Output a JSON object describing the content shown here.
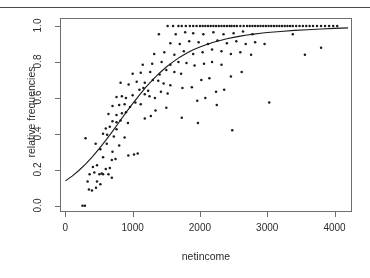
{
  "figure": {
    "xlabel": "netincome",
    "ylabel": "relative frequencies",
    "point_color": "#1a1a1a",
    "curve_color": "#1a1a1a",
    "axis_color": "#6e6e6e"
  },
  "axis": {
    "x_ticks": [
      "0",
      "1000",
      "2000",
      "3000",
      "4000"
    ],
    "y_ticks": [
      "0.0",
      "0.2",
      "0.4",
      "0.6",
      "0.8",
      "1.0"
    ]
  },
  "chart_data": {
    "type": "scatter",
    "title": "",
    "xlabel": "netincome",
    "ylabel": "relative frequencies",
    "xlim": [
      -80,
      4260
    ],
    "ylim": [
      -0.035,
      1.045
    ],
    "xticks": [
      0,
      1000,
      2000,
      3000,
      4000
    ],
    "yticks": [
      0.0,
      0.2,
      0.4,
      0.6,
      0.8,
      1.0
    ],
    "grid": false,
    "legend": null,
    "series": [
      {
        "name": "relative frequencies",
        "marker": "point",
        "points": [
          [
            255,
            0.0
          ],
          [
            290,
            0.0
          ],
          [
            350,
            0.09
          ],
          [
            395,
            0.085
          ],
          [
            455,
            0.1
          ],
          [
            330,
            0.135
          ],
          [
            470,
            0.135
          ],
          [
            520,
            0.12
          ],
          [
            360,
            0.175
          ],
          [
            430,
            0.185
          ],
          [
            505,
            0.175
          ],
          [
            540,
            0.18
          ],
          [
            560,
            0.175
          ],
          [
            640,
            0.175
          ],
          [
            690,
            0.155
          ],
          [
            410,
            0.215
          ],
          [
            470,
            0.225
          ],
          [
            600,
            0.205
          ],
          [
            660,
            0.21
          ],
          [
            300,
            0.375
          ],
          [
            560,
            0.27
          ],
          [
            690,
            0.255
          ],
          [
            745,
            0.26
          ],
          [
            935,
            0.28
          ],
          [
            1020,
            0.285
          ],
          [
            1075,
            0.29
          ],
          [
            520,
            0.315
          ],
          [
            700,
            0.3
          ],
          [
            450,
            0.345
          ],
          [
            615,
            0.345
          ],
          [
            800,
            0.335
          ],
          [
            560,
            0.4
          ],
          [
            620,
            0.395
          ],
          [
            720,
            0.385
          ],
          [
            880,
            0.38
          ],
          [
            600,
            0.43
          ],
          [
            660,
            0.44
          ],
          [
            760,
            0.425
          ],
          [
            700,
            0.47
          ],
          [
            760,
            0.465
          ],
          [
            820,
            0.475
          ],
          [
            930,
            0.46
          ],
          [
            640,
            0.51
          ],
          [
            760,
            0.505
          ],
          [
            840,
            0.515
          ],
          [
            900,
            0.52
          ],
          [
            1180,
            0.485
          ],
          [
            1270,
            0.5
          ],
          [
            700,
            0.555
          ],
          [
            800,
            0.56
          ],
          [
            880,
            0.565
          ],
          [
            960,
            0.55
          ],
          [
            1040,
            0.575
          ],
          [
            1120,
            0.565
          ],
          [
            760,
            0.605
          ],
          [
            840,
            0.61
          ],
          [
            900,
            0.6
          ],
          [
            1000,
            0.615
          ],
          [
            1180,
            0.62
          ],
          [
            1250,
            0.61
          ],
          [
            1330,
            0.6
          ],
          [
            1100,
            0.645
          ],
          [
            1160,
            0.655
          ],
          [
            1230,
            0.64
          ],
          [
            1420,
            0.635
          ],
          [
            1520,
            0.625
          ],
          [
            820,
            0.685
          ],
          [
            940,
            0.675
          ],
          [
            1060,
            0.69
          ],
          [
            1180,
            0.685
          ],
          [
            1300,
            0.7
          ],
          [
            1380,
            0.695
          ],
          [
            1460,
            0.68
          ],
          [
            1560,
            0.67
          ],
          [
            1740,
            0.655
          ],
          [
            1880,
            0.66
          ],
          [
            1000,
            0.735
          ],
          [
            1120,
            0.74
          ],
          [
            1260,
            0.745
          ],
          [
            1400,
            0.73
          ],
          [
            1500,
            0.755
          ],
          [
            1620,
            0.745
          ],
          [
            1720,
            0.735
          ],
          [
            1150,
            0.785
          ],
          [
            1290,
            0.79
          ],
          [
            1430,
            0.8
          ],
          [
            1560,
            0.785
          ],
          [
            1680,
            0.8
          ],
          [
            1800,
            0.795
          ],
          [
            1920,
            0.78
          ],
          [
            2060,
            0.79
          ],
          [
            2180,
            0.8
          ],
          [
            2320,
            0.785
          ],
          [
            1320,
            0.845
          ],
          [
            1470,
            0.855
          ],
          [
            1620,
            0.84
          ],
          [
            1760,
            0.86
          ],
          [
            1900,
            0.845
          ],
          [
            2040,
            0.855
          ],
          [
            2180,
            0.87
          ],
          [
            2320,
            0.86
          ],
          [
            2460,
            0.845
          ],
          [
            2600,
            0.855
          ],
          [
            2760,
            0.84
          ],
          [
            1560,
            0.905
          ],
          [
            1700,
            0.9
          ],
          [
            1840,
            0.915
          ],
          [
            1980,
            0.91
          ],
          [
            2120,
            0.9
          ],
          [
            2260,
            0.92
          ],
          [
            2400,
            0.905
          ],
          [
            2540,
            0.915
          ],
          [
            2680,
            0.9
          ],
          [
            2820,
            0.91
          ],
          [
            2960,
            0.9
          ],
          [
            1390,
            0.955
          ],
          [
            1640,
            0.955
          ],
          [
            1780,
            0.965
          ],
          [
            1900,
            0.96
          ],
          [
            2050,
            0.955
          ],
          [
            2200,
            0.965
          ],
          [
            2350,
            0.955
          ],
          [
            2500,
            0.96
          ],
          [
            2640,
            0.97
          ],
          [
            2780,
            0.955
          ],
          [
            3380,
            0.955
          ],
          [
            1520,
            1.0
          ],
          [
            1600,
            1.0
          ],
          [
            1680,
            1.0
          ],
          [
            1730,
            1.0
          ],
          [
            1790,
            1.0
          ],
          [
            1850,
            1.0
          ],
          [
            1900,
            1.0
          ],
          [
            1950,
            1.0
          ],
          [
            2000,
            1.0
          ],
          [
            2040,
            1.0
          ],
          [
            2080,
            1.0
          ],
          [
            2120,
            1.0
          ],
          [
            2160,
            1.0
          ],
          [
            2200,
            1.0
          ],
          [
            2240,
            1.0
          ],
          [
            2280,
            1.0
          ],
          [
            2320,
            1.0
          ],
          [
            2360,
            1.0
          ],
          [
            2400,
            1.0
          ],
          [
            2440,
            1.0
          ],
          [
            2470,
            1.0
          ],
          [
            2510,
            1.0
          ],
          [
            2550,
            1.0
          ],
          [
            2600,
            1.0
          ],
          [
            2650,
            1.0
          ],
          [
            2700,
            1.0
          ],
          [
            2740,
            1.0
          ],
          [
            2780,
            1.0
          ],
          [
            2820,
            1.0
          ],
          [
            2860,
            1.0
          ],
          [
            2900,
            1.0
          ],
          [
            2940,
            1.0
          ],
          [
            2980,
            1.0
          ],
          [
            3020,
            1.0
          ],
          [
            3060,
            1.0
          ],
          [
            3100,
            1.0
          ],
          [
            3140,
            1.0
          ],
          [
            3180,
            1.0
          ],
          [
            3220,
            1.0
          ],
          [
            3260,
            1.0
          ],
          [
            3300,
            1.0
          ],
          [
            3340,
            1.0
          ],
          [
            3380,
            1.0
          ],
          [
            3430,
            1.0
          ],
          [
            3480,
            1.0
          ],
          [
            3530,
            1.0
          ],
          [
            3580,
            1.0
          ],
          [
            3630,
            1.0
          ],
          [
            3680,
            1.0
          ],
          [
            3740,
            1.0
          ],
          [
            3800,
            1.0
          ],
          [
            3860,
            1.0
          ],
          [
            3920,
            1.0
          ],
          [
            3980,
            1.0
          ],
          [
            4040,
            1.0
          ],
          [
            2240,
            0.635
          ],
          [
            2360,
            0.645
          ],
          [
            2020,
            0.7
          ],
          [
            2140,
            0.71
          ],
          [
            1960,
            0.585
          ],
          [
            2080,
            0.6
          ],
          [
            2250,
            0.56
          ],
          [
            2460,
            0.72
          ],
          [
            2620,
            0.745
          ],
          [
            3030,
            0.575
          ],
          [
            3560,
            0.84
          ],
          [
            3800,
            0.88
          ],
          [
            2480,
            0.42
          ],
          [
            1970,
            0.46
          ],
          [
            1730,
            0.49
          ],
          [
            1500,
            0.545
          ],
          [
            1340,
            0.53
          ]
        ]
      }
    ],
    "fit_curve": {
      "name": "fitted logistic curve",
      "type": "line",
      "points": [
        [
          0,
          0.138
        ],
        [
          100,
          0.165
        ],
        [
          200,
          0.196
        ],
        [
          300,
          0.232
        ],
        [
          400,
          0.272
        ],
        [
          500,
          0.316
        ],
        [
          600,
          0.364
        ],
        [
          700,
          0.414
        ],
        [
          800,
          0.466
        ],
        [
          900,
          0.518
        ],
        [
          1000,
          0.568
        ],
        [
          1100,
          0.616
        ],
        [
          1200,
          0.661
        ],
        [
          1300,
          0.702
        ],
        [
          1400,
          0.739
        ],
        [
          1500,
          0.772
        ],
        [
          1600,
          0.801
        ],
        [
          1700,
          0.827
        ],
        [
          1800,
          0.849
        ],
        [
          1900,
          0.868
        ],
        [
          2000,
          0.884
        ],
        [
          2100,
          0.898
        ],
        [
          2200,
          0.91
        ],
        [
          2300,
          0.92
        ],
        [
          2400,
          0.929
        ],
        [
          2500,
          0.937
        ],
        [
          2600,
          0.944
        ],
        [
          2700,
          0.95
        ],
        [
          2800,
          0.955
        ],
        [
          2900,
          0.96
        ],
        [
          3000,
          0.964
        ],
        [
          3200,
          0.97
        ],
        [
          3400,
          0.976
        ],
        [
          3600,
          0.98
        ],
        [
          3800,
          0.984
        ],
        [
          4000,
          0.987
        ],
        [
          4200,
          0.99
        ]
      ]
    }
  }
}
